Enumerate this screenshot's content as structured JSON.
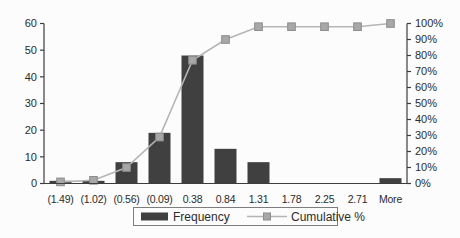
{
  "chart_data": {
    "type": "bar",
    "subtype": "histogram-pareto (frequency bars + cumulative % line)",
    "title": "",
    "xlabel": "",
    "ylabel": "",
    "grid": false,
    "categories": [
      "(1.49)",
      "(1.02)",
      "(0.56)",
      "(0.09)",
      "0.38",
      "0.84",
      "1.31",
      "1.78",
      "2.25",
      "2.71",
      "More"
    ],
    "series": [
      {
        "name": "Frequency",
        "type": "bar",
        "axis": "left",
        "values": [
          1,
          1,
          8,
          19,
          48,
          13,
          8,
          0,
          0,
          0,
          2
        ]
      },
      {
        "name": "Cumulative %",
        "type": "line-marker",
        "axis": "right",
        "values": [
          1,
          2,
          10,
          29,
          77,
          90,
          98,
          98,
          98,
          98,
          100
        ]
      }
    ],
    "left_axis": {
      "min": 0,
      "max": 60,
      "ticks": [
        "0",
        "10",
        "20",
        "30",
        "40",
        "50",
        "60"
      ]
    },
    "right_axis": {
      "min": 0,
      "max": 100,
      "ticks": [
        "0%",
        "10%",
        "20%",
        "30%",
        "40%",
        "50%",
        "60%",
        "70%",
        "80%",
        "90%",
        "100%"
      ]
    },
    "legend": {
      "position": "bottom-center",
      "entries": [
        "Frequency",
        "Cumulative %"
      ]
    }
  },
  "colors": {
    "background": "#fcfcfc",
    "bar": "#404040",
    "line": "#b5b5b5",
    "marker_fill": "#a8a8a8",
    "marker_edge": "#8c8c8c",
    "axis": "#3d3d3d",
    "text": "#2b2b2b",
    "legend_border": "#7d7d7d",
    "legend_bg": "#fcfcfc"
  }
}
